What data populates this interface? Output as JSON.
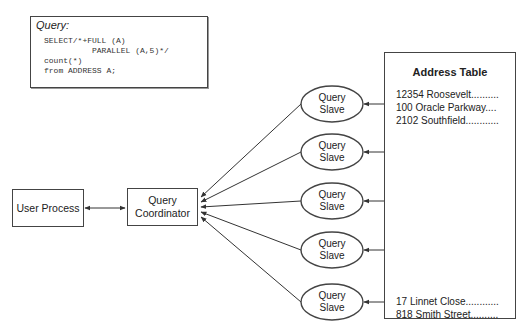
{
  "query": {
    "title": "Query:",
    "code": "SELECT/*+FULL (A)\n          PARALLEL (A,5)*/\ncount(*)\nfrom ADDRESS A;"
  },
  "user_process": {
    "label": "User Process"
  },
  "coordinator": {
    "label": "Query\nCoordinator"
  },
  "slaves": [
    {
      "label": "Query\nSlave"
    },
    {
      "label": "Query\nSlave"
    },
    {
      "label": "Query\nSlave"
    },
    {
      "label": "Query\nSlave"
    },
    {
      "label": "Query\nSlave"
    }
  ],
  "address_table": {
    "title": "Address Table",
    "top_rows": [
      "12354 Roosevelt..........",
      "100 Oracle Parkway....",
      "2102 Southfield............"
    ],
    "ellipsis_dot_count": 8,
    "bottom_rows": [
      "17 Linnet Close............",
      "818 Smith Street.........."
    ]
  },
  "colors": {
    "line": "#333333",
    "border": "#444444",
    "dot": "#111111"
  }
}
